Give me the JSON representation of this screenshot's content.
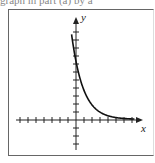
{
  "caption": "graph in part (a) by a",
  "axes": {
    "x_label": "x",
    "y_label": "y"
  },
  "chart_data": {
    "type": "line",
    "title": "",
    "xlabel": "x",
    "ylabel": "y",
    "grid": false,
    "xlim": [
      -7,
      8
    ],
    "ylim": [
      -4,
      12
    ],
    "x_ticks_every": 1,
    "y_ticks_every": 1,
    "series": [
      {
        "name": "exponential decay",
        "x": [
          -0.5,
          0,
          1,
          2,
          3,
          4,
          5,
          6,
          7
        ],
        "y": [
          10.5,
          7.25,
          3.6,
          1.8,
          0.9,
          0.45,
          0.23,
          0.11,
          0.06
        ]
      }
    ]
  }
}
